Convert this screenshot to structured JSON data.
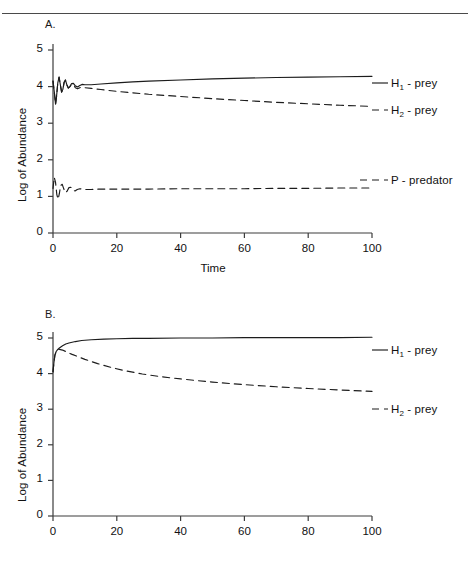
{
  "figure": {
    "background": "#ffffff",
    "line_color": "#1c1c1c",
    "panels": [
      {
        "id": "A",
        "label": "A.",
        "xlabel": "Time",
        "ylabel": "Log of Abundance",
        "x_ticks": [
          "0",
          "20",
          "40",
          "60",
          "80",
          "100"
        ],
        "y_ticks": [
          "0",
          "1",
          "2",
          "3",
          "4",
          "5"
        ],
        "legend": [
          {
            "name": "H1-prey",
            "base": "H",
            "sub": "1",
            "suffix": " - prey",
            "style": "solid"
          },
          {
            "name": "H2-prey",
            "base": "H",
            "sub": "2",
            "suffix": " - prey",
            "style": "dashed"
          },
          {
            "name": "P-predator",
            "base": "P",
            "sub": "",
            "suffix": " - predator",
            "style": "dashed"
          }
        ]
      },
      {
        "id": "B",
        "label": "B.",
        "xlabel": "",
        "ylabel": "Log of Abundance",
        "x_ticks": [
          "0",
          "20",
          "40",
          "60",
          "80",
          "100"
        ],
        "y_ticks": [
          "0",
          "1",
          "2",
          "3",
          "4",
          "5"
        ],
        "legend": [
          {
            "name": "H1-prey",
            "base": "H",
            "sub": "1",
            "suffix": " - prey",
            "style": "solid"
          },
          {
            "name": "H2-prey",
            "base": "H",
            "sub": "2",
            "suffix": " - prey",
            "style": "dashed"
          }
        ]
      }
    ]
  },
  "chart_data": [
    {
      "type": "line",
      "panel": "A",
      "title": "A.",
      "xlabel": "Time",
      "ylabel": "Log of Abundance",
      "xlim": [
        0,
        100
      ],
      "ylim": [
        0,
        5
      ],
      "xticks": [
        0,
        20,
        40,
        60,
        80,
        100
      ],
      "yticks": [
        0,
        1,
        2,
        3,
        4,
        5
      ],
      "grid": false,
      "legend_position": "right-outside",
      "series": [
        {
          "name": "H1 - prey",
          "style": "solid",
          "x": [
            0,
            0.4,
            0.8,
            1.1,
            1.5,
            1.9,
            2.3,
            2.7,
            3.1,
            3.5,
            3.9,
            4.3,
            4.8,
            5.3,
            5.8,
            6.4,
            7.0,
            7.7,
            8.4,
            9.2,
            10,
            12,
            15,
            20,
            25,
            30,
            40,
            50,
            60,
            70,
            80,
            90,
            100
          ],
          "y": [
            4.15,
            3.86,
            3.52,
            3.72,
            4.1,
            4.26,
            4.05,
            3.85,
            3.93,
            4.12,
            4.18,
            4.06,
            3.96,
            4.0,
            4.08,
            4.09,
            4.02,
            3.99,
            4.03,
            4.06,
            4.05,
            4.05,
            4.07,
            4.1,
            4.13,
            4.15,
            4.18,
            4.21,
            4.23,
            4.25,
            4.26,
            4.27,
            4.28
          ]
        },
        {
          "name": "H2 - prey",
          "style": "dashed",
          "x": [
            0,
            0.4,
            0.8,
            1.1,
            1.5,
            1.9,
            2.3,
            2.7,
            3.1,
            3.5,
            3.9,
            4.3,
            4.8,
            5.3,
            5.8,
            6.4,
            7.0,
            7.7,
            8.4,
            9.2,
            10,
            12,
            15,
            20,
            25,
            30,
            40,
            50,
            60,
            70,
            80,
            90,
            100
          ],
          "y": [
            4.15,
            3.86,
            3.52,
            3.72,
            4.1,
            4.26,
            4.05,
            3.85,
            3.93,
            4.12,
            4.18,
            4.06,
            3.96,
            4.0,
            4.06,
            4.05,
            3.97,
            3.94,
            3.97,
            3.99,
            3.97,
            3.95,
            3.92,
            3.87,
            3.83,
            3.79,
            3.73,
            3.67,
            3.62,
            3.57,
            3.53,
            3.49,
            3.46
          ]
        },
        {
          "name": "P - predator",
          "style": "dashed",
          "x": [
            0,
            0.4,
            0.8,
            1.2,
            1.6,
            2.0,
            2.4,
            2.9,
            3.4,
            3.9,
            4.4,
            5.0,
            5.6,
            6.2,
            6.9,
            7.6,
            8.4,
            9.2,
            10,
            12,
            15,
            20,
            30,
            40,
            50,
            60,
            70,
            80,
            90,
            100
          ],
          "y": [
            1.22,
            1.52,
            1.38,
            1.05,
            0.92,
            1.08,
            1.3,
            1.33,
            1.2,
            1.1,
            1.14,
            1.24,
            1.25,
            1.17,
            1.15,
            1.19,
            1.21,
            1.2,
            1.19,
            1.19,
            1.2,
            1.2,
            1.2,
            1.21,
            1.21,
            1.21,
            1.22,
            1.22,
            1.23,
            1.23
          ]
        }
      ]
    },
    {
      "type": "line",
      "panel": "B",
      "title": "B.",
      "xlabel": "",
      "ylabel": "Log of Abundance",
      "xlim": [
        0,
        100
      ],
      "ylim": [
        0,
        5
      ],
      "xticks": [
        0,
        20,
        40,
        60,
        80,
        100
      ],
      "yticks": [
        0,
        1,
        2,
        3,
        4,
        5
      ],
      "grid": false,
      "legend_position": "right-outside",
      "series": [
        {
          "name": "H1 - prey",
          "style": "solid",
          "x": [
            0,
            0.3,
            0.6,
            1.0,
            1.5,
            2,
            3,
            4,
            5,
            7,
            9,
            12,
            16,
            20,
            25,
            30,
            40,
            50,
            60,
            70,
            80,
            90,
            100
          ],
          "y": [
            4.05,
            4.32,
            4.52,
            4.62,
            4.68,
            4.72,
            4.78,
            4.83,
            4.86,
            4.9,
            4.93,
            4.95,
            4.97,
            4.98,
            4.99,
            4.99,
            5.0,
            5.0,
            5.01,
            5.01,
            5.01,
            5.01,
            5.02
          ]
        },
        {
          "name": "H2 - prey",
          "style": "dashed",
          "x": [
            0,
            0.3,
            0.6,
            1.0,
            1.5,
            2,
            3,
            4,
            6,
            8,
            10,
            14,
            18,
            22,
            28,
            34,
            40,
            50,
            60,
            70,
            80,
            90,
            100
          ],
          "y": [
            4.05,
            4.32,
            4.52,
            4.62,
            4.67,
            4.68,
            4.66,
            4.62,
            4.54,
            4.47,
            4.4,
            4.28,
            4.18,
            4.09,
            3.99,
            3.91,
            3.85,
            3.76,
            3.69,
            3.63,
            3.58,
            3.54,
            3.5
          ]
        }
      ]
    }
  ]
}
